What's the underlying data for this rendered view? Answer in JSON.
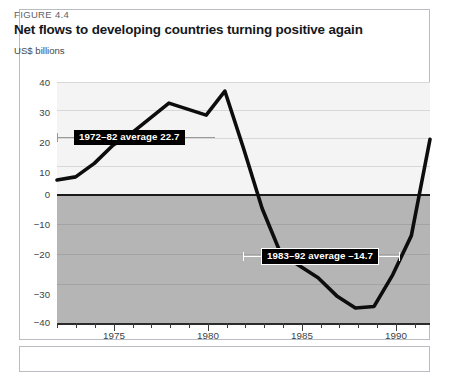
{
  "figure": {
    "number_label": "FIGURE 4.4",
    "title": "Net flows to developing countries turning positive again",
    "unit_label": "US$ billions"
  },
  "chart_data": {
    "type": "line",
    "title": "Net flows to developing countries turning positive again",
    "subtitle": "FIGURE 4.4",
    "xlabel": "",
    "ylabel": "US$ billions",
    "ylim": [
      -40,
      40
    ],
    "xlim": [
      1972,
      1992
    ],
    "yticks": [
      40,
      30,
      20,
      10,
      0,
      -10,
      -20,
      -30,
      -40
    ],
    "ytick_labels": [
      "40",
      "30",
      "20",
      "10",
      "0",
      "−10",
      "−20",
      "−30",
      "−40"
    ],
    "xticks": [
      1975,
      1980,
      1985,
      1990
    ],
    "xtick_labels": [
      "1975",
      "1980",
      "1985",
      "1990"
    ],
    "grid": true,
    "legend": "none",
    "series": [
      {
        "name": "Net flows to developing countries",
        "x": [
          1972,
          1973,
          1974,
          1975,
          1976,
          1977,
          1978,
          1979,
          1980,
          1981,
          1982,
          1983,
          1984,
          1985,
          1986,
          1987,
          1988,
          1989,
          1990,
          1991,
          1992
        ],
        "values": [
          7.5,
          8.5,
          13.0,
          19.0,
          23.0,
          28.0,
          33.0,
          31.0,
          29.0,
          37.0,
          18.0,
          -2.0,
          -17.0,
          -21.0,
          -25.0,
          -31.0,
          -35.0,
          -34.5,
          -24.0,
          -11.0,
          21.0
        ]
      }
    ],
    "annotations": [
      {
        "id": "avg-1972-82",
        "label": "1972–82 average  22.7",
        "value": 22.7,
        "period": "1972–82",
        "x_start": 1972,
        "x_end": 1982
      },
      {
        "id": "avg-1983-92",
        "label": "1983–92 average  –14.7",
        "value": -14.7,
        "period": "1983–92",
        "x_start": 1983,
        "x_end": 1992
      }
    ],
    "colors": {
      "line": "#0d0d0d",
      "positive_background": "#f4f4f4",
      "negative_background": "#b5b5b5",
      "zero_line": "#1a1a1a",
      "gridline": "#d8d8d8",
      "annotation_background": "#000000",
      "annotation_text": "#ffffff"
    }
  }
}
